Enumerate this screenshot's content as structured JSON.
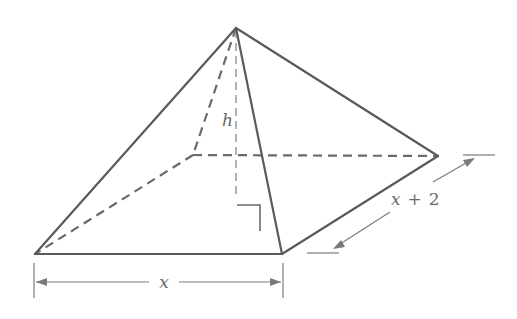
{
  "diagram": {
    "labels": {
      "height": "h",
      "front_width": "x",
      "depth_var": "x",
      "depth_op": "+",
      "depth_const": "2"
    },
    "vertices": {
      "apex": [
        236,
        28
      ],
      "back_left": [
        193,
        155
      ],
      "back_right": [
        438,
        156
      ],
      "front_left": [
        35,
        254
      ],
      "front_right": [
        282,
        254
      ],
      "height_foot": [
        236,
        198
      ]
    },
    "colors": {
      "edge": "#5a5a5a",
      "hidden_edge": "#6a6a6a",
      "dimension": "#7a7a7a",
      "text": "#6a6a6a"
    }
  }
}
